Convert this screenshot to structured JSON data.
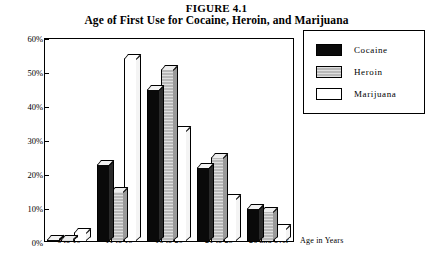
{
  "chart_data": {
    "type": "bar",
    "title": "FIGURE 4.1",
    "subtitle": "Age of First Use for Cocaine, Heroin, and Marijuana",
    "xlabel": "Age in Years",
    "ylabel": "",
    "ylim": [
      0,
      60
    ],
    "grid": false,
    "legend_position": "right",
    "ytick_labels": [
      "60%",
      "50%",
      "40%",
      "30%",
      "20%",
      "10%",
      "0%"
    ],
    "ytick_values": [
      60,
      50,
      40,
      30,
      20,
      10,
      0
    ],
    "categories": [
      "6 to 10",
      "11 to 15",
      "16 to 20",
      "21 to 25",
      "26 and over"
    ],
    "series": [
      {
        "name": "Cocaine",
        "color": "#0a0a0a",
        "values": [
          1,
          23,
          45,
          22,
          10
        ]
      },
      {
        "name": "Heroin",
        "color": "#b8b8b8",
        "values": [
          1,
          15,
          51,
          25,
          9
        ]
      },
      {
        "name": "Marijuana",
        "color": "#ffffff",
        "values": [
          3,
          54,
          33,
          13,
          4
        ]
      }
    ]
  },
  "legend": {
    "items": [
      {
        "label": "Cocaine"
      },
      {
        "label": "Heroin"
      },
      {
        "label": "Marijuana"
      }
    ]
  }
}
